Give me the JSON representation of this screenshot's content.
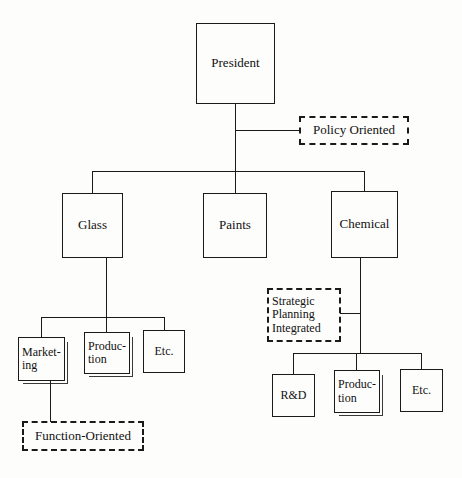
{
  "diagram": {
    "background_color": "#fdfdfc",
    "line_color": "#1a1a1a",
    "nodes": {
      "president": {
        "label": "President",
        "style": "solid"
      },
      "policy_oriented": {
        "label": "Policy Oriented",
        "style": "dashed"
      },
      "glass": {
        "label": "Glass",
        "style": "solid"
      },
      "paints": {
        "label": "Paints",
        "style": "solid"
      },
      "chemical": {
        "label": "Chemical",
        "style": "solid"
      },
      "marketing": {
        "label": "Market-\ning",
        "style": "solid"
      },
      "glass_production": {
        "label": "Produc-\ntion",
        "style": "solid"
      },
      "glass_etc": {
        "label": "Etc.",
        "style": "solid"
      },
      "function_oriented": {
        "label": "Function-Oriented",
        "style": "dashed"
      },
      "strategic_planning": {
        "label": "Strategic\nPlanning\nIntegrated",
        "style": "dashed"
      },
      "rnd": {
        "label": "R&D",
        "style": "solid"
      },
      "chemical_production": {
        "label": "Produc-\ntion",
        "style": "solid"
      },
      "chemical_etc": {
        "label": "Etc.",
        "style": "solid"
      }
    }
  }
}
